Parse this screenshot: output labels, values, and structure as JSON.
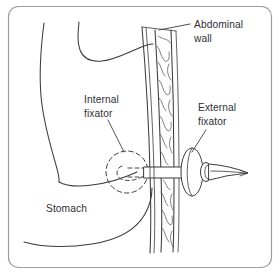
{
  "figure": {
    "background_color": "#ffffff",
    "frame_color": "#9a9a9f",
    "ink_color": "#3b3b41",
    "text_color": "#2f2f34"
  },
  "labels": {
    "abdominal_wall": {
      "line1": "Abdominal",
      "line2": "wall"
    },
    "internal_fixator": {
      "line1": "Internal",
      "line2": "fixator"
    },
    "external_fixator": {
      "line1": "External",
      "line2": "fixator"
    },
    "stomach": {
      "line1": "Stomach"
    }
  },
  "structures": [
    {
      "name": "stomach-outline",
      "kind": "organ-wall"
    },
    {
      "name": "abdominal-wall-band",
      "kind": "tissue-layer"
    },
    {
      "name": "internal-fixator-disc",
      "kind": "device",
      "style": "hidden-dashed"
    },
    {
      "name": "external-fixator-flange",
      "kind": "device",
      "style": "solid"
    },
    {
      "name": "feeding-tube",
      "kind": "device",
      "style": "solid"
    }
  ]
}
